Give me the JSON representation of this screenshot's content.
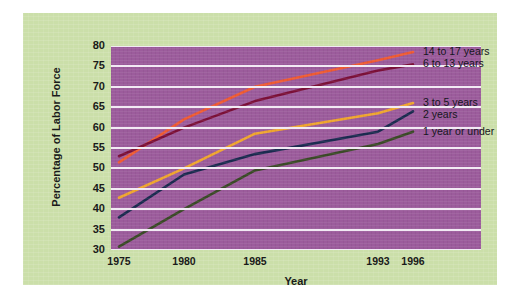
{
  "chart_data": {
    "type": "line",
    "title": "",
    "xlabel": "Year",
    "ylabel": "Percentage of Labor Force",
    "x": [
      1975,
      1980,
      1985,
      1993,
      1996
    ],
    "xtick_labels": [
      "1975",
      "1980",
      "1985",
      "1993",
      "1996"
    ],
    "ytick_labels": [
      "30",
      "35",
      "40",
      "45",
      "50",
      "55",
      "60",
      "65",
      "70",
      "75",
      "80"
    ],
    "ylim": [
      30,
      80
    ],
    "ytick_step": 5,
    "grid": "horizontal",
    "legend_position": "right-inline-labels",
    "plot_background": "#9c5c9c",
    "panel_background": "#cbdfa9",
    "gridline_color": "#f2eaf4",
    "series": [
      {
        "name": "14 to 17 years",
        "color": "#ef5b33",
        "values": [
          51.5,
          62.0,
          70.0,
          76.5,
          78.5
        ]
      },
      {
        "name": "6 to 13 years",
        "color": "#7c1038",
        "values": [
          53.0,
          60.0,
          66.5,
          74.0,
          75.5
        ]
      },
      {
        "name": "3 to 5 years",
        "color": "#f0a62e",
        "values": [
          42.8,
          50.0,
          58.5,
          63.5,
          66.0
        ]
      },
      {
        "name": "2 years",
        "color": "#1b2b50",
        "values": [
          38.0,
          48.5,
          53.5,
          59.0,
          64.0
        ]
      },
      {
        "name": "1 year or under",
        "color": "#3b4a27",
        "values": [
          30.8,
          40.0,
          49.5,
          56.0,
          59.0
        ]
      }
    ]
  },
  "axis": {
    "y_title": "Percentage of Labor Force",
    "x_title": "Year"
  },
  "legend": {
    "items": [
      {
        "label": "14 to 17 years"
      },
      {
        "label": "6 to 13 years"
      },
      {
        "label": "3 to 5 years"
      },
      {
        "label": "2 years"
      },
      {
        "label": "1 year or under"
      }
    ]
  }
}
